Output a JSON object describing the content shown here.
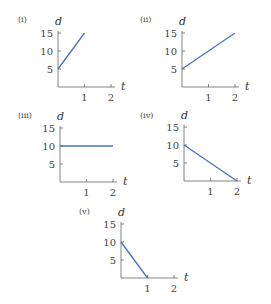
{
  "chart_data": [
    {
      "type": "line",
      "label": "(i)",
      "xlabel": "t",
      "ylabel": "d",
      "xticks": [
        1,
        2
      ],
      "yticks": [
        5,
        10,
        15
      ],
      "series": [
        {
          "name": "d",
          "x": [
            0,
            1
          ],
          "y": [
            5,
            15
          ]
        }
      ],
      "xlim": [
        0,
        2
      ],
      "ylim": [
        0,
        15
      ],
      "color": "#4a6fc1",
      "origin": [
        58,
        87
      ],
      "xscale": 26.5,
      "yscale": 3.6,
      "labelpos": [
        18,
        22
      ]
    },
    {
      "type": "line",
      "label": "(ii)",
      "xlabel": "t",
      "ylabel": "d",
      "xticks": [
        1,
        2
      ],
      "yticks": [
        5,
        10,
        15
      ],
      "series": [
        {
          "name": "d",
          "x": [
            0,
            2
          ],
          "y": [
            5,
            15
          ]
        }
      ],
      "xlim": [
        0,
        2
      ],
      "ylim": [
        0,
        15
      ],
      "color": "#4a6fc1",
      "origin": [
        182,
        87
      ],
      "xscale": 26.5,
      "yscale": 3.6,
      "labelpos": [
        140,
        22
      ]
    },
    {
      "type": "line",
      "label": "(iii)",
      "xlabel": "t",
      "ylabel": "d",
      "xticks": [
        1,
        2
      ],
      "yticks": [
        5,
        10,
        15
      ],
      "series": [
        {
          "name": "d",
          "x": [
            0,
            2
          ],
          "y": [
            10,
            10
          ]
        }
      ],
      "xlim": [
        0,
        2
      ],
      "ylim": [
        0,
        15
      ],
      "color": "#4a6fc1",
      "origin": [
        60,
        182
      ],
      "xscale": 26.5,
      "yscale": 3.6,
      "labelpos": [
        18,
        118
      ]
    },
    {
      "type": "line",
      "label": "(iv)",
      "xlabel": "t",
      "ylabel": "d",
      "xticks": [
        1,
        2
      ],
      "yticks": [
        5,
        10,
        15
      ],
      "series": [
        {
          "name": "d",
          "x": [
            0,
            2
          ],
          "y": [
            10,
            0
          ]
        }
      ],
      "xlim": [
        0,
        2
      ],
      "ylim": [
        0,
        15
      ],
      "color": "#4a6fc1",
      "origin": [
        184,
        181
      ],
      "xscale": 26.5,
      "yscale": 3.6,
      "labelpos": [
        140,
        118
      ]
    },
    {
      "type": "line",
      "label": "(v)",
      "xlabel": "t",
      "ylabel": "d",
      "xticks": [
        1,
        2
      ],
      "yticks": [
        5,
        10,
        15
      ],
      "series": [
        {
          "name": "d",
          "x": [
            0,
            1
          ],
          "y": [
            10,
            0
          ]
        }
      ],
      "xlim": [
        0,
        2
      ],
      "ylim": [
        0,
        15
      ],
      "color": "#4a6fc1",
      "origin": [
        121,
        278
      ],
      "xscale": 26.5,
      "yscale": 3.6,
      "labelpos": [
        79,
        214
      ]
    }
  ]
}
